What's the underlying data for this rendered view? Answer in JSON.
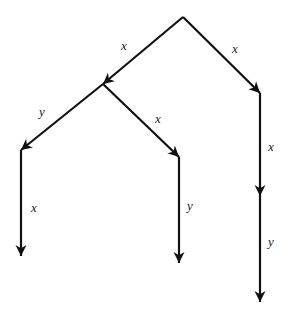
{
  "diagram": {
    "type": "tree",
    "colors": {
      "line": "#111111",
      "label": "#222222",
      "background": "#ffffff"
    },
    "nodes": [
      {
        "id": "root",
        "x": 183,
        "y": 17
      },
      {
        "id": "n_left",
        "x": 103,
        "y": 84
      },
      {
        "id": "n_right",
        "x": 260,
        "y": 93
      },
      {
        "id": "n_left_left",
        "x": 21,
        "y": 150
      },
      {
        "id": "n_left_right",
        "x": 179,
        "y": 157
      },
      {
        "id": "n_right_mid",
        "x": 260,
        "y": 196
      },
      {
        "id": "leaf_1",
        "x": 21,
        "y": 256
      },
      {
        "id": "leaf_2",
        "x": 179,
        "y": 263
      },
      {
        "id": "leaf_3",
        "x": 260,
        "y": 302
      }
    ],
    "edges": [
      {
        "from": "root",
        "to": "n_left",
        "label": "x",
        "label_x": 121,
        "label_y": 50
      },
      {
        "from": "root",
        "to": "n_right",
        "label": "x",
        "label_x": 232,
        "label_y": 53
      },
      {
        "from": "n_left",
        "to": "n_left_left",
        "label": "y",
        "label_x": 39,
        "label_y": 116
      },
      {
        "from": "n_left",
        "to": "n_left_right",
        "label": "x",
        "label_x": 155,
        "label_y": 123
      },
      {
        "from": "n_right",
        "to": "n_right_mid",
        "label": "x",
        "label_x": 268,
        "label_y": 151
      },
      {
        "from": "n_left_left",
        "to": "leaf_1",
        "label": "x",
        "label_x": 31,
        "label_y": 212
      },
      {
        "from": "n_left_right",
        "to": "leaf_2",
        "label": "y",
        "label_x": 187,
        "label_y": 210
      },
      {
        "from": "n_right_mid",
        "to": "leaf_3",
        "label": "y",
        "label_x": 268,
        "label_y": 246
      }
    ]
  }
}
